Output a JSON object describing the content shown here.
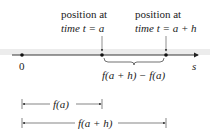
{
  "labels": {
    "pos_a_line1": "position at",
    "pos_a_line2": "time t = a",
    "pos_ah_line1": "position at",
    "pos_ah_line2": "time t = a + h",
    "origin": "0",
    "axis": "s",
    "difference": "f(a + h) − f(a)",
    "fa": "f(a)",
    "fah": "f(a + h)"
  },
  "colors": {
    "line": "#222222",
    "band": "#e6e6e6"
  }
}
